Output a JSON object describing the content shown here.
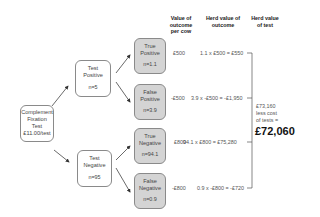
{
  "headers": {
    "value_per_cow": "Value of outcome per cow",
    "herd_value_outcome": "Herd value of outcome",
    "herd_value_test": "Herd value of test"
  },
  "root": {
    "line1": "Complement",
    "line2": "Fixation",
    "line3": "Test",
    "line4": "£11.00/test"
  },
  "test_positive": {
    "line1": "Test",
    "line2": "Positive",
    "n": "n=5"
  },
  "test_negative": {
    "line1": "Test",
    "line2": "Negative",
    "n": "n=95"
  },
  "outcomes": [
    {
      "line1": "True",
      "line2": "Positive",
      "n": "n=1.1",
      "per_cow": "£500",
      "herd": "1.1 x £500 = £550"
    },
    {
      "line1": "False",
      "line2": "Positive",
      "n": "n=3.9",
      "per_cow": "-£500",
      "herd": "3.9 x -£500 = -£1,950"
    },
    {
      "line1": "True",
      "line2": "Negative",
      "n": "n=94.1",
      "per_cow": "£800",
      "herd": "94.1 x £800 = £75,280"
    },
    {
      "line1": "False",
      "line2": "Negative",
      "n": "n=0.9",
      "per_cow": "-£800",
      "herd": "0.9 x -£800 = -£720"
    }
  ],
  "summary": {
    "line1": "£73,160",
    "line2": "less cost",
    "line3": "of tests =",
    "total": "£72,060"
  },
  "colors": {
    "outcome_fill": "#d4d4d4",
    "border": "#8a8a8a",
    "line": "#444444"
  }
}
